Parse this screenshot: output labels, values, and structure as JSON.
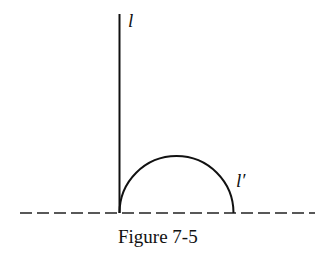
{
  "diagram": {
    "line_label": "l",
    "arc_label": "l′",
    "caption": "Figure 7-5",
    "colors": {
      "stroke": "#111111",
      "background": "#ffffff"
    }
  }
}
